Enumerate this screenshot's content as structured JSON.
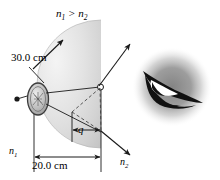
{
  "figure": {
    "background_color": "#ffffff",
    "width": 220,
    "height": 180
  },
  "labels": {
    "index_relation": "n",
    "index_relation_sub1": "1",
    "index_relation_op": " > n",
    "index_relation_sub2": "2",
    "radius": "30.0 cm",
    "object_distance": "20.0 cm",
    "image_distance": "q",
    "medium_incident": "n",
    "medium_incident_sub": "1",
    "medium_transmitted": "n",
    "medium_transmitted_sub": "2"
  },
  "colors": {
    "medium_fill_light": "#efefef",
    "medium_fill_dark": "#c9c9c9",
    "line": "#1a1a1a",
    "dashed_line": "#555555",
    "eye_blur": "#8a8a8a",
    "coin_fill": "#b5b5b5",
    "coin_highlight": "#e8e8e8"
  },
  "elements": {
    "medium_region_name": "semicircular-medium-n1",
    "coin_name": "coin-object",
    "refraction_point_name": "refraction-point",
    "eye_name": "observer-eye",
    "radius_arrow_name": "radius-arrow",
    "object_distance_arrow_name": "object-distance-arrow",
    "image_distance_arrow_name": "image-distance-arrow",
    "refracted_ray_upper_name": "refracted-ray-upper",
    "refracted_ray_lower_name": "refracted-ray-lower"
  }
}
